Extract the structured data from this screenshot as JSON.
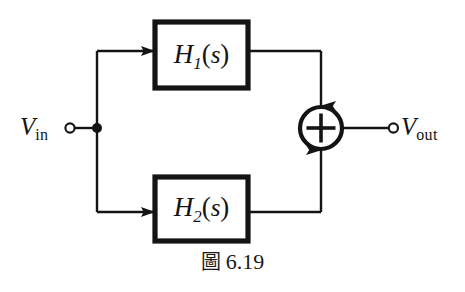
{
  "figure": {
    "caption_marker": "圖",
    "caption_number": "6.19",
    "background_color": "#ffffff",
    "ink_color": "#141414"
  },
  "terminals": {
    "input": {
      "symbol": "V",
      "subscript": "in",
      "terminal_type": "open-circle"
    },
    "output": {
      "symbol": "V",
      "subscript": "out",
      "terminal_type": "open-circle"
    }
  },
  "blocks": [
    {
      "id": "h1",
      "symbol": "H",
      "subscript": "1",
      "argument": "(s)",
      "arg_open": "(",
      "arg_var": "s",
      "arg_close": ")"
    },
    {
      "id": "h2",
      "symbol": "H",
      "subscript": "2",
      "argument": "(s)",
      "arg_open": "(",
      "arg_var": "s",
      "arg_close": ")"
    }
  ],
  "summing_junction": {
    "operator": "+",
    "shape": "circle"
  },
  "junction_node": {
    "type": "filled-dot"
  }
}
